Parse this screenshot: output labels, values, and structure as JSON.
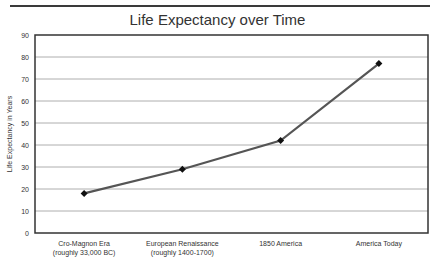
{
  "chart_data": {
    "type": "line",
    "title": "Life Expectancy over Time",
    "xlabel": "",
    "ylabel": "Life Expectancy in Years",
    "ylim": [
      0,
      90
    ],
    "yticks": [
      0,
      10,
      20,
      30,
      40,
      50,
      60,
      70,
      80,
      90
    ],
    "ytick_labels": [
      "0",
      "10",
      "20",
      "30",
      "40",
      "50",
      "60",
      "70",
      "80",
      "90"
    ],
    "grid": true,
    "legend": "none",
    "categories": [
      [
        "Cro-Magnon Era",
        "(roughly 33,000 BC)"
      ],
      [
        "European Renaissance",
        "(roughly 1400-1700)"
      ],
      [
        "1850 America"
      ],
      [
        "America Today"
      ]
    ],
    "series": [
      {
        "name": "Life Expectancy",
        "values": [
          18,
          29,
          42,
          77
        ],
        "color": "#555555",
        "marker": "diamond",
        "marker_color": "#111111"
      }
    ]
  }
}
